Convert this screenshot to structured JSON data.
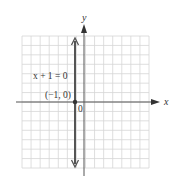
{
  "chart_data": {
    "type": "line",
    "title": "",
    "xlabel": "x",
    "ylabel": "y",
    "xlim": [
      -7,
      7
    ],
    "ylim": [
      -7,
      7
    ],
    "grid": true,
    "series": [
      {
        "name": "x + 1 = 0",
        "kind": "vertical-line",
        "x": [
          -1,
          -1
        ],
        "y": [
          -7,
          7
        ]
      }
    ],
    "points": [
      {
        "label": "(−1, 0)",
        "x": -1,
        "y": 0
      }
    ],
    "annotations": [
      {
        "text": "x + 1 = 0",
        "x": -4,
        "y": 2.5
      },
      {
        "text": "(−1, 0)",
        "x": -2.5,
        "y": 0.8
      },
      {
        "text": "0",
        "x": 0.1,
        "y": -0.8
      }
    ]
  },
  "labels": {
    "x_axis": "x",
    "y_axis": "y",
    "equation": "x + 1 = 0",
    "point": "(−1, 0)",
    "origin": "0"
  },
  "colors": {
    "grid": "#d6d6d6",
    "axis": "#555555",
    "line": "#555555",
    "text": "#333333"
  }
}
